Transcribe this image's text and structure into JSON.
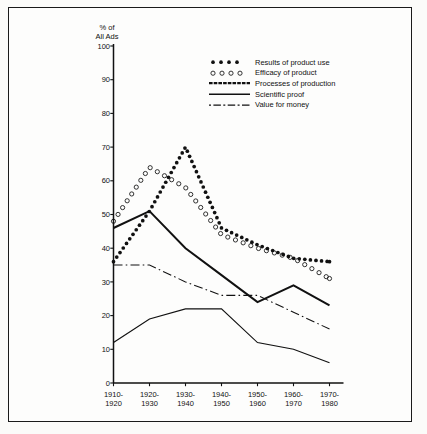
{
  "figure": {
    "background_color": "#fbfbf9",
    "frame_color": "#1a1a1a",
    "ink_color": "#111111"
  },
  "axis": {
    "y_title_line1": "% of",
    "y_title_line2": "All Ads",
    "y_ticks": [
      "100",
      "90",
      "80",
      "70",
      "60",
      "50",
      "40",
      "30",
      "20",
      "10",
      "0"
    ],
    "x_ticks": [
      {
        "top": "1910-",
        "bottom": "1920"
      },
      {
        "top": "1920-",
        "bottom": "1930"
      },
      {
        "top": "1930-",
        "bottom": "1940"
      },
      {
        "top": "1940-",
        "bottom": "1950"
      },
      {
        "top": "1950-",
        "bottom": "1960"
      },
      {
        "top": "1960-",
        "bottom": "1970"
      },
      {
        "top": "1970-",
        "bottom": "1980"
      }
    ]
  },
  "legend": {
    "entries": [
      {
        "label": "Results of product use",
        "key": "filled-dots"
      },
      {
        "label": "Efficacy of product",
        "key": "open-circles"
      },
      {
        "label": "Processes of production",
        "key": "thick-solid"
      },
      {
        "label": "Scientific proof",
        "key": "thin-solid"
      },
      {
        "label": "Value for money",
        "key": "dash-dot"
      }
    ]
  },
  "chart_data": {
    "type": "line",
    "title": "",
    "subtitle": "",
    "xlabel": "",
    "ylabel": "% of All Ads",
    "ylim": [
      0,
      100
    ],
    "ytick_step": 10,
    "grid": false,
    "legend_position": "top-right inside plot",
    "categories": [
      "1910-1920",
      "1920-1930",
      "1930-1940",
      "1940-1950",
      "1950-1960",
      "1960-1970",
      "1970-1980"
    ],
    "series": [
      {
        "name": "Results of product use",
        "style": "filled-dots",
        "values": [
          36,
          51,
          70,
          46,
          41,
          37,
          36
        ]
      },
      {
        "name": "Efficacy of product",
        "style": "open-circles",
        "values": [
          48,
          64,
          58,
          44,
          40,
          37,
          31
        ]
      },
      {
        "name": "Processes of production",
        "style": "thick-solid",
        "values": [
          46,
          51,
          40,
          32,
          24,
          29,
          23
        ]
      },
      {
        "name": "Scientific proof",
        "style": "thin-solid",
        "values": [
          12,
          19,
          22,
          22,
          12,
          10,
          6
        ]
      },
      {
        "name": "Value for money",
        "style": "dash-dot",
        "values": [
          35,
          35,
          30,
          26,
          26,
          21,
          16
        ]
      }
    ]
  }
}
